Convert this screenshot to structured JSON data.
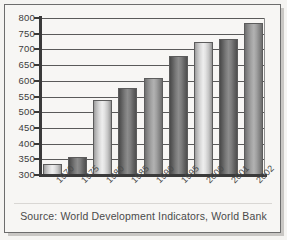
{
  "caption": "Source: World Development Indicators, World Bank",
  "colors": {
    "frame": "#6d6d6d",
    "axis": "#3a3a3a",
    "gridline": "#5a5a5a",
    "text": "#4a4a4a",
    "background": "#f7f6f4",
    "bar_light": "#eeeeee",
    "bar_dark": "#7a7a7a"
  },
  "chart_data": {
    "type": "bar",
    "title": "",
    "subtitle": "",
    "xlabel": "",
    "ylabel": "",
    "categories": [
      "1970",
      "1975",
      "1980",
      "1985",
      "1990",
      "1995",
      "2000",
      "2001",
      "2002"
    ],
    "values": [
      335,
      358,
      540,
      578,
      610,
      680,
      725,
      732,
      785
    ],
    "series": [
      {
        "name": "",
        "values": [
          335,
          358,
          540,
          578,
          610,
          680,
          725,
          732,
          785
        ]
      }
    ],
    "ylim": [
      300,
      800
    ],
    "yticks": [
      300,
      350,
      400,
      450,
      500,
      550,
      600,
      650,
      700,
      750,
      800
    ],
    "ytick_labels": [
      "300",
      "350",
      "400",
      "450",
      "500",
      "550",
      "600",
      "650",
      "700",
      "750",
      "800"
    ],
    "grid": true,
    "grid_axis": "y",
    "legend": false,
    "legend_position": "none",
    "bar_shading": [
      "light",
      "dark",
      "light",
      "dark",
      "mid",
      "dark",
      "light",
      "dark",
      "mid"
    ],
    "annotations": [
      "Source: World Development Indicators, World Bank"
    ],
    "xtick_label_rotation": -45
  }
}
